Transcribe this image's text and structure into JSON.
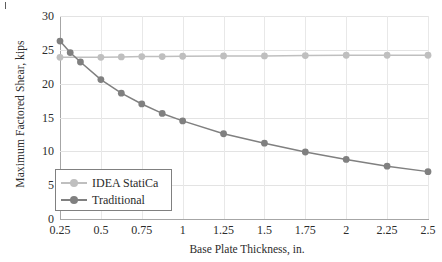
{
  "chart_data": {
    "type": "line",
    "title": "",
    "xlabel": "Base Plate Thickness, in.",
    "ylabel": "Maximum Factored Shear, kips",
    "x": [
      0.25,
      0.3125,
      0.375,
      0.5,
      0.625,
      0.75,
      0.875,
      1,
      1.25,
      1.5,
      1.75,
      2,
      2.25,
      2.5
    ],
    "xlim": [
      0.25,
      2.5
    ],
    "ylim": [
      0,
      30
    ],
    "xticks": [
      "0.25",
      "0.5",
      "0.75",
      "1",
      "1.25",
      "1.5",
      "1.75",
      "2",
      "2.25",
      "2.5"
    ],
    "xtick_values": [
      0.25,
      0.5,
      0.75,
      1,
      1.25,
      1.5,
      1.75,
      2,
      2.25,
      2.5
    ],
    "yticks": [
      "0",
      "5",
      "10",
      "15",
      "20",
      "25",
      "30"
    ],
    "ytick_values": [
      0,
      5,
      10,
      15,
      20,
      25,
      30
    ],
    "grid": "both",
    "legend_position": "lower-left-inside",
    "series": [
      {
        "name": "IDEA StatiCa",
        "color": "#bfbfbf",
        "values": [
          23.9,
          23.9,
          23.9,
          23.9,
          23.95,
          24.0,
          24.0,
          24.05,
          24.1,
          24.1,
          24.15,
          24.2,
          24.2,
          24.2
        ]
      },
      {
        "name": "Traditional",
        "color": "#808080",
        "values": [
          26.3,
          24.6,
          23.2,
          20.6,
          18.6,
          17.0,
          15.6,
          14.5,
          12.6,
          11.2,
          9.9,
          8.8,
          7.8,
          7.0
        ]
      }
    ]
  },
  "legend": {
    "items": [
      {
        "label": "IDEA StatiCa",
        "color": "#bfbfbf"
      },
      {
        "label": "Traditional",
        "color": "#808080"
      }
    ]
  },
  "colors": {
    "idea_staticalight": "#bfbfbf",
    "traditional": "#808080",
    "grid": "#e3e3e3",
    "axis": "#a6a6a6",
    "text": "#2b2b2b"
  }
}
